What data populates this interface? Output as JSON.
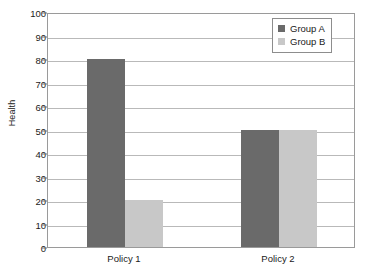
{
  "chart_data": {
    "type": "bar",
    "title": "",
    "xlabel": "",
    "ylabel": "Health",
    "categories": [
      "Policy 1",
      "Policy 2"
    ],
    "series": [
      {
        "name": "Group A",
        "values": [
          80,
          50
        ],
        "color": "#6a6a6a"
      },
      {
        "name": "Group B",
        "values": [
          20,
          50
        ],
        "color": "#c8c8c8"
      }
    ],
    "ylim": [
      0,
      100
    ],
    "ytick_step": 10,
    "yticks": [
      0,
      10,
      20,
      30,
      40,
      50,
      60,
      70,
      80,
      90,
      100
    ],
    "ytick_labels": [
      "0",
      "10",
      "20",
      "30",
      "40",
      "50",
      "60",
      "70",
      "80",
      "90",
      "100"
    ],
    "grid": true,
    "grid_axis": "y",
    "legend": true,
    "legend_position": "top-right",
    "legend_entries": [
      "Group A",
      "Group B"
    ],
    "bar_group_gap": true,
    "background_color": "#ffffff",
    "grid_color": "#b9b9b9",
    "frame_color": "#9a9a9a",
    "text_color": "#1a1a1a"
  }
}
